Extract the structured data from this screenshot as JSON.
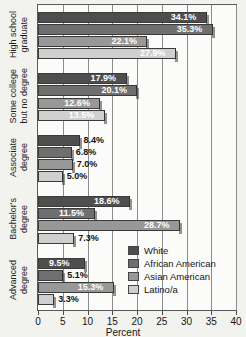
{
  "chart_data": {
    "type": "bar",
    "orientation": "horizontal",
    "title": "",
    "xlabel": "Percent",
    "ylabel": "",
    "xlim": [
      0,
      40
    ],
    "xticks": [
      0,
      5,
      10,
      15,
      20,
      25,
      30,
      35,
      40
    ],
    "grid": true,
    "legend_position": "inside-lower-right",
    "categories": [
      "High school graduate",
      "Some college but no degree",
      "Associate degree",
      "Bachelor's degree",
      "Advanced degree"
    ],
    "category_lines": [
      [
        "High school",
        "graduate"
      ],
      [
        "Some college",
        "but no degree"
      ],
      [
        "Associate",
        "degree"
      ],
      [
        "Bachelor's",
        "degree"
      ],
      [
        "Advanced",
        "degree"
      ]
    ],
    "series": [
      {
        "name": "White",
        "color": "#4e4e4e",
        "values": [
          34.1,
          17.9,
          8.4,
          18.6,
          9.5
        ],
        "labels": [
          "34.1%",
          "17.9%",
          "8.4%",
          "18.6%",
          "9.5%"
        ]
      },
      {
        "name": "African American",
        "color": "#6f6f6f",
        "values": [
          35.3,
          20.1,
          6.8,
          11.5,
          5.1
        ],
        "labels": [
          "35.3%",
          "20.1%",
          "6.8%",
          "11.5%",
          "5.1%"
        ]
      },
      {
        "name": "Asian American",
        "color": "#989898",
        "values": [
          22.1,
          12.6,
          7.0,
          28.7,
          15.3
        ],
        "labels": [
          "22.1%",
          "12.6%",
          "7.0%",
          "28.7%",
          "15.3%"
        ]
      },
      {
        "name": "Latino/a",
        "color": "#cfcfcf",
        "values": [
          27.9,
          13.5,
          5.0,
          7.3,
          3.3
        ],
        "labels": [
          "27.9%",
          "13.5%",
          "5.0%",
          "7.3%",
          "3.3%"
        ]
      }
    ]
  }
}
